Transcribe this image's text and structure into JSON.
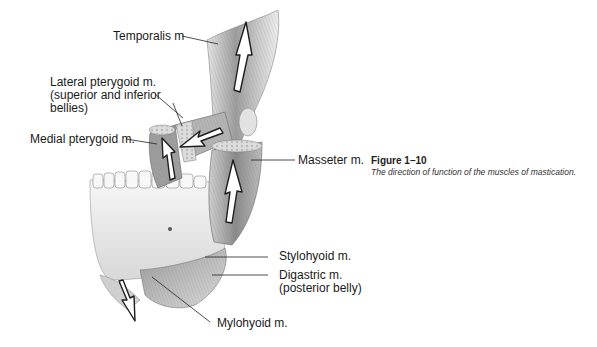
{
  "figure": {
    "number": "Figure 1–10",
    "caption": "The direction of function of the muscles of mastication."
  },
  "labels": {
    "temporalis": "Temporalis m",
    "lateral_pterygoid": [
      "Lateral pterygoid m.",
      "(superior and inferior",
      "bellies)"
    ],
    "medial_pterygoid": "Medial pterygoid m.",
    "masseter": "Masseter m.",
    "stylohyoid": "Stylohyoid m.",
    "digastric": [
      "Digastric m.",
      "(posterior belly)"
    ],
    "mylohyoid": "Mylohyoid m."
  },
  "colors": {
    "line": "#222222",
    "muscle_dark": "#6e6e6e",
    "muscle_mid": "#a8a8a8",
    "muscle_light": "#d9d9d9",
    "bone": "#efefef"
  }
}
